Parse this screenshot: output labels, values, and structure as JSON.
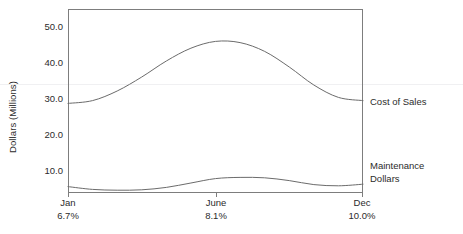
{
  "chart_data": {
    "type": "line",
    "title": "",
    "subtitle": "",
    "xlabel": "",
    "ylabel": "Dollars (Millions)",
    "ylim": [
      6,
      52
    ],
    "yticks": [
      50.0,
      40.0,
      30.0,
      20.0,
      10.0
    ],
    "ytick_labels": [
      "50.0",
      "40.0",
      "30.0",
      "20.0",
      "10.0"
    ],
    "grid": false,
    "legend_position": "right-of-line-ends",
    "categories": [
      "Jan",
      "June",
      "Dec"
    ],
    "x": [
      0,
      6,
      12
    ],
    "x_tick_labels": [
      "Jan",
      "June",
      "Dec"
    ],
    "x_secondary_labels": [
      "6.7%",
      "8.1%",
      "10.0%"
    ],
    "series": [
      {
        "name": "Cost of Sales",
        "values": [
          28.4,
          29.1,
          31.5,
          35.0,
          39.0,
          42.2,
          43.9,
          43.6,
          41.4,
          37.5,
          33.0,
          29.9,
          29.1
        ],
        "x": [
          0,
          1,
          2,
          3,
          4,
          5,
          6,
          7,
          8,
          9,
          10,
          11,
          12
        ],
        "label_x": "Dec",
        "label_value": 29.1
      },
      {
        "name": "Maintenance Dollars",
        "values": [
          7.6,
          6.9,
          6.7,
          6.8,
          7.4,
          8.5,
          9.6,
          9.9,
          9.8,
          9.1,
          8.1,
          7.8,
          8.2
        ],
        "x": [
          0,
          1,
          2,
          3,
          4,
          5,
          6,
          7,
          8,
          9,
          10,
          11,
          12
        ],
        "label_x": "Dec",
        "label_value": 8.2
      }
    ],
    "annotations": []
  },
  "axes": {
    "y_title": "Dollars (Millions)",
    "y_tick_labels": [
      "50.0",
      "40.0",
      "30.0",
      "20.0",
      "10.0"
    ],
    "x_groups": [
      {
        "month": "Jan",
        "pct": "6.7%"
      },
      {
        "month": "June",
        "pct": "8.1%"
      },
      {
        "month": "Dec",
        "pct": "10.0%"
      }
    ]
  },
  "series_labels": [
    {
      "line1": "Cost of Sales",
      "line2": ""
    },
    {
      "line1": "Maintenance",
      "line2": "Dollars"
    }
  ],
  "colors": {
    "line": "#6b6b6b",
    "frame": "#7d7d7d",
    "text": "#2b2b2b",
    "background": "#ffffff"
  }
}
